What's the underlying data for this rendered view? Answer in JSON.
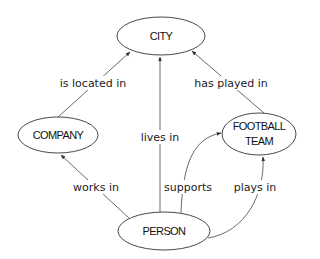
{
  "diagram": {
    "type": "entity-relationship graph",
    "nodes": [
      {
        "id": "city",
        "label_lines": [
          "CITY"
        ],
        "cx": 161,
        "cy": 36,
        "rx": 44,
        "ry": 19
      },
      {
        "id": "company",
        "label_lines": [
          "COMPANY"
        ],
        "cx": 58,
        "cy": 135,
        "rx": 40,
        "ry": 18
      },
      {
        "id": "football_team",
        "label_lines": [
          "FOOTBALL",
          "TEAM"
        ],
        "cx": 259,
        "cy": 134,
        "rx": 37,
        "ry": 21
      },
      {
        "id": "person",
        "label_lines": [
          "PERSON"
        ],
        "cx": 164,
        "cy": 231,
        "rx": 46,
        "ry": 19
      }
    ],
    "edges": [
      {
        "id": "is_located_in",
        "from": "company",
        "to": "city",
        "label": "is located in"
      },
      {
        "id": "has_played_in",
        "from": "football_team",
        "to": "city",
        "label": "has played in"
      },
      {
        "id": "lives_in",
        "from": "person",
        "to": "city",
        "label": "lives in"
      },
      {
        "id": "works_in",
        "from": "person",
        "to": "company",
        "label": "works in"
      },
      {
        "id": "supports",
        "from": "person",
        "to": "football_team",
        "label": "supports"
      },
      {
        "id": "plays_in",
        "from": "person",
        "to": "football_team",
        "label": "plays in"
      }
    ]
  },
  "labels": {
    "city": "CITY",
    "company": "COMPANY",
    "football_line1": "FOOTBALL",
    "football_line2": "TEAM",
    "person": "PERSON",
    "is_located_in": "is located in",
    "has_played_in": "has played in",
    "lives_in": "lives in",
    "works_in": "works in",
    "supports": "supports",
    "plays_in": "plays in"
  },
  "colors": {
    "background": "#ffffff",
    "stroke": "#333333",
    "text": "#111111"
  }
}
